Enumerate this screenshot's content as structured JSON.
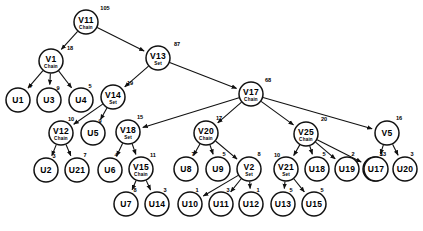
{
  "diagram": {
    "type": "tree",
    "background_color": "#ffffff",
    "stroke_color": "#111111",
    "node_shape": "circle",
    "node_radius": 11.5,
    "weight_position": "upper-right of node / on incoming edge"
  },
  "nodes": [
    {
      "id": "V11",
      "label": "V11",
      "sub": "Chain",
      "weight": "105",
      "x": 86,
      "y": 22,
      "r": 12
    },
    {
      "id": "V1",
      "label": "V1",
      "sub": "Chain",
      "weight": "18",
      "x": 51,
      "y": 61,
      "r": 12
    },
    {
      "id": "V13",
      "label": "V13",
      "sub": "Set",
      "weight": "87",
      "x": 158,
      "y": 58,
      "r": 12
    },
    {
      "id": "U1",
      "label": "U1",
      "sub": "",
      "weight": "4",
      "x": 18,
      "y": 100,
      "r": 12
    },
    {
      "id": "U3",
      "label": "U3",
      "sub": "",
      "weight": "9",
      "x": 49,
      "y": 100,
      "r": 12
    },
    {
      "id": "U4",
      "label": "U4",
      "sub": "",
      "weight": "5",
      "x": 81,
      "y": 100,
      "r": 12
    },
    {
      "id": "V14",
      "label": "V14",
      "sub": "Set",
      "weight": "19",
      "x": 113,
      "y": 97,
      "r": 12
    },
    {
      "id": "V17",
      "label": "V17",
      "sub": "Chain",
      "weight": "68",
      "x": 251,
      "y": 94,
      "r": 12
    },
    {
      "id": "V12",
      "label": "V12",
      "sub": "Chain",
      "weight": "10",
      "x": 61,
      "y": 133,
      "r": 12
    },
    {
      "id": "U5",
      "label": "U5",
      "sub": "",
      "weight": "9",
      "x": 93,
      "y": 133,
      "r": 12
    },
    {
      "id": "V18",
      "label": "V18",
      "sub": "Set",
      "weight": "15",
      "x": 128,
      "y": 132,
      "r": 12
    },
    {
      "id": "V20",
      "label": "V20",
      "sub": "Chain",
      "weight": "17",
      "x": 206,
      "y": 133,
      "r": 12
    },
    {
      "id": "V25",
      "label": "V25",
      "sub": "Chain",
      "weight": "20",
      "x": 306,
      "y": 134,
      "r": 12
    },
    {
      "id": "V5",
      "label": "V5",
      "sub": "",
      "weight": "16",
      "x": 387,
      "y": 133,
      "r": 12
    },
    {
      "id": "U2",
      "label": "U2",
      "sub": "",
      "weight": "3",
      "x": 46,
      "y": 170,
      "r": 12
    },
    {
      "id": "U21",
      "label": "U21",
      "sub": "",
      "weight": "7",
      "x": 77,
      "y": 170,
      "r": 12
    },
    {
      "id": "U6",
      "label": "U6",
      "sub": "",
      "weight": "4",
      "x": 110,
      "y": 170,
      "r": 12
    },
    {
      "id": "V15",
      "label": "V15",
      "sub": "Chain",
      "weight": "11",
      "x": 141,
      "y": 169,
      "r": 12
    },
    {
      "id": "U8",
      "label": "U8",
      "sub": "",
      "weight": "7",
      "x": 186,
      "y": 169,
      "r": 12
    },
    {
      "id": "U9",
      "label": "U9",
      "sub": "",
      "weight": "5",
      "x": 218,
      "y": 169,
      "r": 12
    },
    {
      "id": "V2",
      "label": "V2",
      "sub": "Set",
      "weight": "8",
      "x": 249,
      "y": 169,
      "r": 12
    },
    {
      "id": "V21",
      "label": "V21",
      "sub": "Set",
      "weight": "10",
      "x": 286,
      "y": 169,
      "r": 12
    },
    {
      "id": "U18",
      "label": "U18",
      "sub": "",
      "weight": "5",
      "x": 317,
      "y": 169,
      "r": 12
    },
    {
      "id": "U19",
      "label": "U19",
      "sub": "",
      "weight": "2",
      "x": 347,
      "y": 169,
      "r": 12
    },
    {
      "id": "U16",
      "label": "U16",
      "sub": "",
      "weight": "3",
      "x": 375,
      "y": 169,
      "r": 12
    },
    {
      "id": "U17",
      "label": "U17",
      "sub": "",
      "weight": "13",
      "x": 376,
      "y": 169,
      "r": 12
    },
    {
      "id": "U20",
      "label": "U20",
      "sub": "",
      "weight": "3",
      "x": 405,
      "y": 169,
      "r": 12
    },
    {
      "id": "U7",
      "label": "U7",
      "sub": "",
      "weight": "8",
      "x": 126,
      "y": 204,
      "r": 12
    },
    {
      "id": "U14",
      "label": "U14",
      "sub": "",
      "weight": "3",
      "x": 157,
      "y": 204,
      "r": 12
    },
    {
      "id": "U10",
      "label": "U10",
      "sub": "",
      "weight": "1",
      "x": 190,
      "y": 204,
      "r": 12
    },
    {
      "id": "U11",
      "label": "U11",
      "sub": "",
      "weight": "3",
      "x": 221,
      "y": 204,
      "r": 12
    },
    {
      "id": "U12",
      "label": "U12",
      "sub": "",
      "weight": "1",
      "x": 251,
      "y": 204,
      "r": 12
    },
    {
      "id": "U13",
      "label": "U13",
      "sub": "",
      "weight": "5",
      "x": 283,
      "y": 204,
      "r": 12
    },
    {
      "id": "U15",
      "label": "U15",
      "sub": "",
      "weight": "5",
      "x": 314,
      "y": 204,
      "r": 12
    }
  ],
  "edges": [
    {
      "from": "V11",
      "to": "V1"
    },
    {
      "from": "V11",
      "to": "V13"
    },
    {
      "from": "V1",
      "to": "U1"
    },
    {
      "from": "V1",
      "to": "U3"
    },
    {
      "from": "V1",
      "to": "U4"
    },
    {
      "from": "V13",
      "to": "V14"
    },
    {
      "from": "V13",
      "to": "V17"
    },
    {
      "from": "V14",
      "to": "V12"
    },
    {
      "from": "V14",
      "to": "U5"
    },
    {
      "from": "V17",
      "to": "V18"
    },
    {
      "from": "V17",
      "to": "V20"
    },
    {
      "from": "V17",
      "to": "V25"
    },
    {
      "from": "V17",
      "to": "V5"
    },
    {
      "from": "V12",
      "to": "U2"
    },
    {
      "from": "V12",
      "to": "U21"
    },
    {
      "from": "V18",
      "to": "U6"
    },
    {
      "from": "V18",
      "to": "V15"
    },
    {
      "from": "V15",
      "to": "U7"
    },
    {
      "from": "V15",
      "to": "U14"
    },
    {
      "from": "V20",
      "to": "U8"
    },
    {
      "from": "V20",
      "to": "U9"
    },
    {
      "from": "V20",
      "to": "V2"
    },
    {
      "from": "V2",
      "to": "U10"
    },
    {
      "from": "V2",
      "to": "U11"
    },
    {
      "from": "V2",
      "to": "U12"
    },
    {
      "from": "V25",
      "to": "V21"
    },
    {
      "from": "V25",
      "to": "U18"
    },
    {
      "from": "V25",
      "to": "U19"
    },
    {
      "from": "V25",
      "to": "U16"
    },
    {
      "from": "V21",
      "to": "U13"
    },
    {
      "from": "V21",
      "to": "U15"
    },
    {
      "from": "V5",
      "to": "U17"
    },
    {
      "from": "V5",
      "to": "U20"
    }
  ],
  "weight_label_positions": [
    {
      "node": "V11",
      "x": 105,
      "y": 10
    },
    {
      "node": "V1",
      "x": 70,
      "y": 50
    },
    {
      "node": "V13",
      "x": 177,
      "y": 46
    },
    {
      "node": "U1",
      "x": 30,
      "y": 88
    },
    {
      "node": "U3",
      "x": 58,
      "y": 90
    },
    {
      "node": "U4",
      "x": 90,
      "y": 88
    },
    {
      "node": "V14",
      "x": 130,
      "y": 85
    },
    {
      "node": "V17",
      "x": 268,
      "y": 82
    },
    {
      "node": "V12",
      "x": 71,
      "y": 121
    },
    {
      "node": "U5",
      "x": 100,
      "y": 123
    },
    {
      "node": "V18",
      "x": 140,
      "y": 119
    },
    {
      "node": "V20",
      "x": 219,
      "y": 120
    },
    {
      "node": "V25",
      "x": 324,
      "y": 121
    },
    {
      "node": "V5",
      "x": 399,
      "y": 120
    },
    {
      "node": "U2",
      "x": 54,
      "y": 158
    },
    {
      "node": "U21",
      "x": 85,
      "y": 157
    },
    {
      "node": "U6",
      "x": 116,
      "y": 157
    },
    {
      "node": "V15",
      "x": 153,
      "y": 157
    },
    {
      "node": "U8",
      "x": 193,
      "y": 156
    },
    {
      "node": "U9",
      "x": 224,
      "y": 156
    },
    {
      "node": "V2",
      "x": 259,
      "y": 156
    },
    {
      "node": "V21",
      "x": 277,
      "y": 157
    },
    {
      "node": "U18",
      "x": 324,
      "y": 156
    },
    {
      "node": "U19",
      "x": 353,
      "y": 156
    },
    {
      "node": "U16",
      "x": 381,
      "y": 156
    },
    {
      "node": "U17",
      "x": 383,
      "y": 156
    },
    {
      "node": "U20",
      "x": 412,
      "y": 156
    },
    {
      "node": "U7",
      "x": 135,
      "y": 192
    },
    {
      "node": "U14",
      "x": 165,
      "y": 192
    },
    {
      "node": "U10",
      "x": 197,
      "y": 192
    },
    {
      "node": "U11",
      "x": 228,
      "y": 192
    },
    {
      "node": "U12",
      "x": 258,
      "y": 192
    },
    {
      "node": "U13",
      "x": 291,
      "y": 192
    },
    {
      "node": "U15",
      "x": 322,
      "y": 192
    }
  ]
}
